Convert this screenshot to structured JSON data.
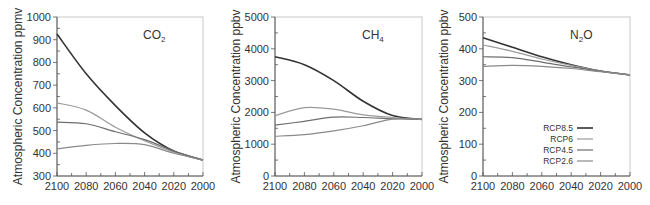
{
  "chart_data": [
    {
      "type": "line",
      "title": "CO2",
      "title_main": "CO",
      "title_sub": "2",
      "xlabel": "",
      "ylabel": "Atmospheric Concentration ppmv",
      "x": [
        2100,
        2080,
        2060,
        2040,
        2020,
        2000
      ],
      "xticks": [
        "2100",
        "2080",
        "2060",
        "2040",
        "2020",
        "2000"
      ],
      "yticks": [
        "300",
        "400",
        "500",
        "600",
        "700",
        "800",
        "900",
        "1000"
      ],
      "ylim": [
        300,
        1000
      ],
      "xlim": [
        2100,
        2000
      ],
      "grid": false,
      "series": [
        {
          "name": "RCP8.5",
          "values": [
            925,
            750,
            610,
            490,
            410,
            370
          ]
        },
        {
          "name": "RCP6",
          "values": [
            622,
            590,
            515,
            455,
            405,
            370
          ]
        },
        {
          "name": "RCP4.5",
          "values": [
            537,
            530,
            495,
            460,
            410,
            370
          ]
        },
        {
          "name": "RCP2.6",
          "values": [
            420,
            435,
            443,
            438,
            400,
            370
          ]
        }
      ]
    },
    {
      "type": "line",
      "title": "CH4",
      "title_main": "CH",
      "title_sub": "4",
      "xlabel": "",
      "ylabel": "Atmospheric Concentration ppbv",
      "x": [
        2100,
        2080,
        2060,
        2040,
        2020,
        2000
      ],
      "xticks": [
        "2100",
        "2080",
        "2060",
        "2040",
        "2020",
        "2000"
      ],
      "yticks": [
        "0",
        "1000",
        "2000",
        "3000",
        "4000",
        "5000"
      ],
      "ylim": [
        0,
        5000
      ],
      "xlim": [
        2100,
        2000
      ],
      "grid": false,
      "series": [
        {
          "name": "RCP8.5",
          "values": [
            3750,
            3500,
            3000,
            2350,
            1900,
            1780
          ]
        },
        {
          "name": "RCP6",
          "values": [
            1900,
            2150,
            2100,
            1920,
            1840,
            1780
          ]
        },
        {
          "name": "RCP4.5",
          "values": [
            1600,
            1720,
            1850,
            1840,
            1800,
            1780
          ]
        },
        {
          "name": "RCP2.6",
          "values": [
            1250,
            1300,
            1420,
            1580,
            1790,
            1780
          ]
        }
      ]
    },
    {
      "type": "line",
      "title": "N2O",
      "title_main": "N",
      "title_sub": "2",
      "title_tail": "O",
      "xlabel": "",
      "ylabel": "Atmospheric Concentration ppbv",
      "x": [
        2100,
        2080,
        2060,
        2040,
        2020,
        2000
      ],
      "xticks": [
        "2100",
        "2080",
        "2060",
        "2040",
        "2020",
        "2000"
      ],
      "yticks": [
        "0",
        "100",
        "200",
        "300",
        "400",
        "500"
      ],
      "ylim": [
        0,
        500
      ],
      "xlim": [
        2100,
        2000
      ],
      "grid": false,
      "legend_position": "lower right",
      "series": [
        {
          "name": "RCP8.5",
          "values": [
            435,
            405,
            375,
            350,
            330,
            318
          ]
        },
        {
          "name": "RCP6",
          "values": [
            412,
            392,
            368,
            348,
            330,
            318
          ]
        },
        {
          "name": "RCP4.5",
          "values": [
            375,
            372,
            358,
            343,
            330,
            318
          ]
        },
        {
          "name": "RCP2.6",
          "values": [
            345,
            348,
            345,
            338,
            328,
            318
          ]
        }
      ]
    }
  ],
  "legend": {
    "entries": [
      "RCP8.5",
      "RCP6",
      "RCP4.5",
      "RCP2.6"
    ]
  },
  "colors": {
    "RCP8.5": "#333333",
    "RCP6": "#9a9a9a",
    "RCP4.5": "#6e6e6e",
    "RCP2.6": "#8a8a8a",
    "axis": "#555555",
    "text": "#333333"
  }
}
